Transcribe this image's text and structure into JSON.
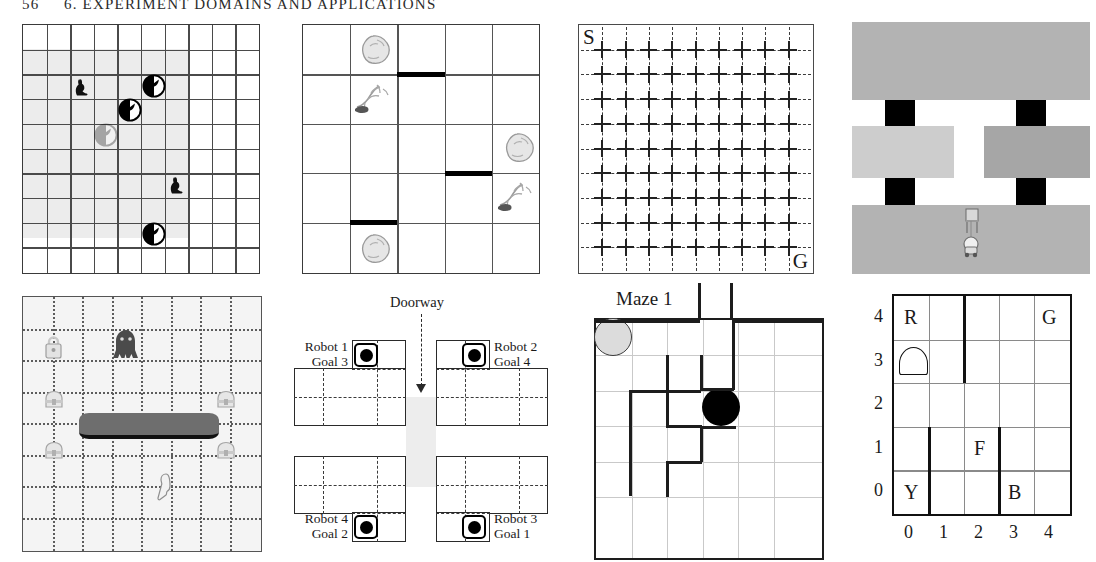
{
  "page": {
    "number": "56",
    "running_head": "6.  EXPERIMENT DOMAINS AND APPLICATIONS"
  },
  "panels": {
    "predator_prey": {
      "name": "predator-prey-gridworld",
      "rows": 10,
      "cols": 10,
      "shaded_region": {
        "row_start": 1,
        "row_end": 8,
        "col_start": 0,
        "col_end": 7
      },
      "prey": [
        {
          "row": 2,
          "col": 2,
          "icon": "rabbit-icon"
        },
        {
          "row": 5,
          "col": 6,
          "icon": "rabbit-icon"
        }
      ],
      "predators": [
        {
          "row": 2,
          "col": 5,
          "icon": "wolf-head-icon",
          "faded": false
        },
        {
          "row": 3,
          "col": 4,
          "icon": "wolf-head-icon",
          "faded": false
        },
        {
          "row": 4,
          "col": 3,
          "icon": "wolf-head-icon",
          "faded": true
        },
        {
          "row": 8,
          "col": 5,
          "icon": "wolf-head-icon",
          "faded": false
        }
      ]
    },
    "rocks_trees": {
      "name": "rocks-and-trees-gridworld",
      "rows": 5,
      "cols": 5,
      "objects": [
        {
          "row": 0,
          "col": 1,
          "icon": "rock-icon"
        },
        {
          "row": 1,
          "col": 1,
          "icon": "tree-icon"
        },
        {
          "row": 2,
          "col": 4,
          "icon": "rock-icon"
        },
        {
          "row": 3,
          "col": 4,
          "icon": "tree-icon"
        },
        {
          "row": 4,
          "col": 1,
          "icon": "rock-icon"
        }
      ],
      "walls": [
        {
          "row": 1,
          "col": 2,
          "side": "top"
        },
        {
          "row": 3,
          "col": 3,
          "side": "top"
        },
        {
          "row": 4,
          "col": 1,
          "side": "top"
        }
      ]
    },
    "start_goal_grid": {
      "name": "start-goal-cross-grid",
      "rows": 10,
      "cols": 10,
      "start_label": "S",
      "goal_label": "G"
    },
    "rooms_corridor": {
      "name": "rooms-with-doorways",
      "rooms": [
        {
          "id": "top",
          "shade": "#b3b3b3"
        },
        {
          "id": "middle-left",
          "shade": "#cdcdcd"
        },
        {
          "id": "middle-right",
          "shade": "#a6a6a6"
        },
        {
          "id": "bottom",
          "shade": "#b3b3b3"
        }
      ],
      "doorways": 4,
      "agent_icon": "robot-icon",
      "colors": {
        "doorway": "#000000"
      }
    },
    "dotted_game": {
      "name": "dotted-grid-game-domain",
      "rows": 8,
      "cols": 8,
      "sprites": [
        {
          "row": 1,
          "col": 0,
          "icon": "lock-icon"
        },
        {
          "row": 1,
          "col": 2,
          "icon": "monster-icon"
        },
        {
          "row": 3,
          "col": 0,
          "icon": "chest-icon"
        },
        {
          "row": 3,
          "col": 7,
          "icon": "chest-icon"
        },
        {
          "row": 4,
          "col": 0,
          "icon": "chest-icon"
        },
        {
          "row": 4,
          "col": 7,
          "icon": "chest-icon"
        },
        {
          "row": 5,
          "col": 3,
          "icon": "key-icon"
        }
      ],
      "obstacle": {
        "icon": "log-obstacle-icon"
      }
    },
    "four_robots": {
      "name": "four-robots-rooms",
      "doorway_label": "Doorway",
      "robots": [
        {
          "id": "r1",
          "line1": "Robot 1",
          "line2": "Goal 3",
          "position": "top-left"
        },
        {
          "id": "r2",
          "line1": "Robot 2",
          "line2": "Goal 4",
          "position": "top-right"
        },
        {
          "id": "r3",
          "line1": "Robot 3",
          "line2": "Goal 1",
          "position": "bottom-right"
        },
        {
          "id": "r4",
          "line1": "Robot 4",
          "line2": "Goal 2",
          "position": "bottom-left"
        }
      ]
    },
    "maze": {
      "name": "maze-domain",
      "title": "Maze 1",
      "start_marker": "gray-circle",
      "goal_marker": "black-circle",
      "colors": {
        "start": "#dcdcdc",
        "goal": "#000000"
      }
    },
    "taxi": {
      "name": "taxi-domain-grid",
      "rows": 5,
      "cols": 5,
      "x_axis": [
        "0",
        "1",
        "2",
        "3",
        "4"
      ],
      "y_axis": [
        "4",
        "3",
        "2",
        "1",
        "0"
      ],
      "landmarks": [
        {
          "label": "R",
          "x": 0,
          "y": 4
        },
        {
          "label": "G",
          "x": 4,
          "y": 4
        },
        {
          "label": "F",
          "x": 2,
          "y": 1
        },
        {
          "label": "Y",
          "x": 0,
          "y": 0
        },
        {
          "label": "B",
          "x": 3,
          "y": 0
        }
      ],
      "taxi_position": {
        "x": 0,
        "y": 3
      },
      "taxi_icon": "taxi-icon"
    }
  }
}
